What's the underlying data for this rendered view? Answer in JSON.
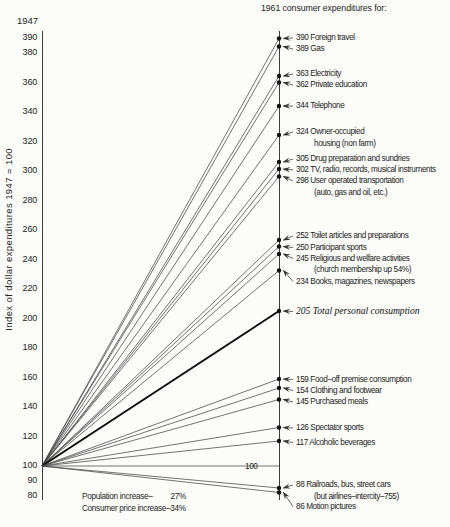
{
  "page": {
    "background": "#fcfcf9",
    "ink": "#242424"
  },
  "chart_data": {
    "type": "line",
    "subtype": "slope-fan",
    "title": "1961 consumer expenditures for:",
    "start_year_label": "1947",
    "y_axis_title": "Index of dollar expenditures 1947 = 100",
    "y_ticks": [
      390,
      380,
      360,
      340,
      320,
      300,
      280,
      260,
      240,
      220,
      200,
      180,
      160,
      140,
      120,
      100,
      90,
      80
    ],
    "ylim": [
      80,
      395
    ],
    "origin_value": 100,
    "legend_position": "none",
    "grid": false,
    "colors": {
      "line": "#454545",
      "emphasis": "#0d0d0d",
      "dot": "#111111",
      "axis": "#3c3c3c",
      "arrow": "#333333"
    },
    "series": [
      {
        "value": 390,
        "label": "390 Foreign travel",
        "label_y": 38,
        "dot_y": 38.5
      },
      {
        "value": 389,
        "label": "389 Gas",
        "label_y": 49,
        "dot_y": 46.5
      },
      {
        "value": 363,
        "label": "363 Electricity",
        "label_y": 74,
        "dot_y": 76
      },
      {
        "value": 362,
        "label": "362 Private education",
        "label_y": 85,
        "dot_y": 82.5
      },
      {
        "value": 344,
        "label": "344 Telephone",
        "label_y": 106,
        "dot_y": 106
      },
      {
        "value": 324,
        "label": "324 Owner-occupied",
        "label2": "housing (non farm)",
        "label_y": 132,
        "dot_y": 135
      },
      {
        "value": 305,
        "label": "305 Drug preparation and sundries",
        "label_y": 159,
        "dot_y": 162
      },
      {
        "value": 302,
        "label": "302 TV, radio, records, musical instruments",
        "label_y": 170,
        "dot_y": 169
      },
      {
        "value": 298,
        "label": "298 User operated transportation",
        "label2": "(auto, gas and oil, etc.)",
        "label_y": 181,
        "dot_y": 176.5
      },
      {
        "value": 252,
        "label": "252 Toilet articles and preparations",
        "label_y": 236,
        "dot_y": 240
      },
      {
        "value": 250,
        "label": "250 Participant sports",
        "label_y": 247.5,
        "dot_y": 246.5
      },
      {
        "value": 245,
        "label": "245 Religious and welfare activities",
        "label2": "(church membership up 54%)",
        "label_y": 258.5,
        "dot_y": 254
      },
      {
        "value": 234,
        "label": "234 Books, magazines, newspapers",
        "label_y": 281.5,
        "dot_y": 270.5
      },
      {
        "value": 205,
        "label": "205 Total personal consumption",
        "label_y": 311.5,
        "dot_y": 311,
        "emphasis": true
      },
      {
        "value": 159,
        "label": "159 Food–off premise consumption",
        "label_y": 379.5,
        "dot_y": 379
      },
      {
        "value": 154,
        "label": "154 Clothing and footwear",
        "label_y": 390.5,
        "dot_y": 388
      },
      {
        "value": 145,
        "label": "145 Purchased meals",
        "label_y": 402,
        "dot_y": 399.5
      },
      {
        "value": 126,
        "label": "126 Spectator sports",
        "label_y": 428,
        "dot_y": 427.5
      },
      {
        "value": 117,
        "label": "117 Alcoholic beverages",
        "label_y": 442.5,
        "dot_y": 441
      },
      {
        "value": 100,
        "label": "100",
        "label_y": 466.5,
        "label_x": 245,
        "reference": true
      },
      {
        "value": 88,
        "label": "88 Railroads, bus, street cars",
        "label2": "(but airlines–intercity–755)",
        "label_y": 485,
        "dot_y": 488
      },
      {
        "value": 86,
        "label": "86 Motion pictures",
        "label_y": 506.5,
        "dot_y": 492.5
      }
    ],
    "annotations": {
      "population_label": "Population increase–",
      "population_value": "27%",
      "price_line": "Consumer price increase–34%"
    }
  }
}
